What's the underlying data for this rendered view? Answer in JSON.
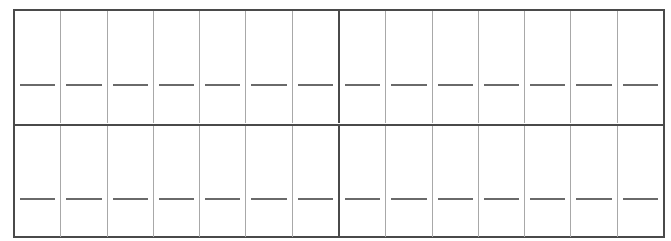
{
  "worksheet": {
    "type": "answer-grid",
    "rows": 2,
    "columns": 14,
    "groups_per_row": 2,
    "cells_per_group": 7,
    "cell_content": "blank-line",
    "colors": {
      "outer_border": "#4a4a4a",
      "cell_divider": "#a8a8a8",
      "blank_line": "#6a6a6a",
      "background": "#ffffff"
    },
    "grid_rows": [
      {
        "groups": [
          {
            "cells": [
              "",
              "",
              "",
              "",
              "",
              "",
              ""
            ]
          },
          {
            "cells": [
              "",
              "",
              "",
              "",
              "",
              "",
              ""
            ]
          }
        ]
      },
      {
        "groups": [
          {
            "cells": [
              "",
              "",
              "",
              "",
              "",
              "",
              ""
            ]
          },
          {
            "cells": [
              "",
              "",
              "",
              "",
              "",
              "",
              ""
            ]
          }
        ]
      }
    ]
  }
}
